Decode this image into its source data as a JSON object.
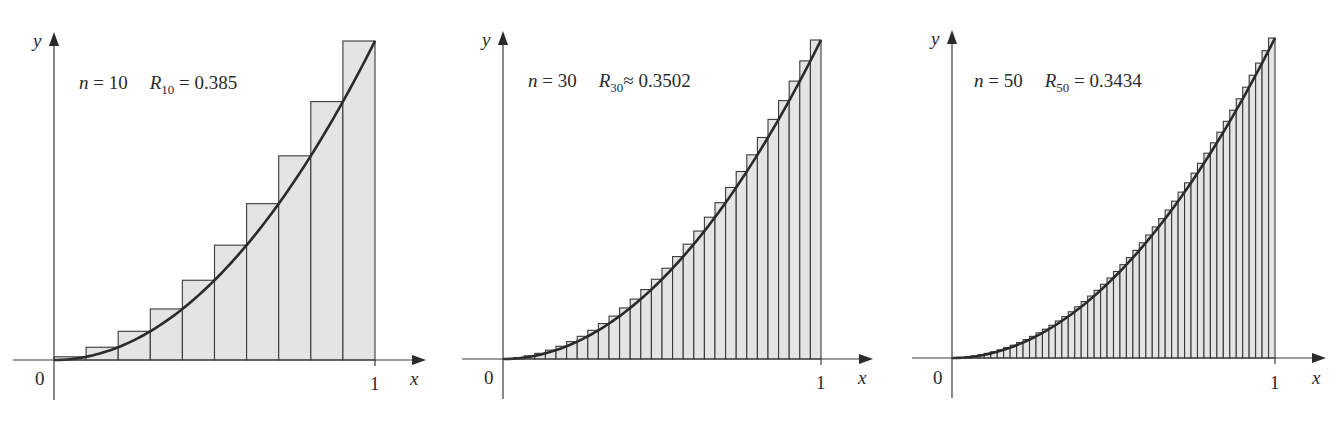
{
  "chart_data": [
    {
      "type": "bar",
      "title": "n = 10   R10 = 0.385",
      "function": "y = x^2",
      "method": "right endpoint Riemann sum",
      "n": 10,
      "annotation": {
        "n_label": "n",
        "n_value": "10",
        "R_label": "R",
        "R_sub": "10",
        "relation": "=",
        "R_value": "0.385"
      },
      "xlabel": "x",
      "ylabel": "y",
      "x_ticks": [
        "0",
        "1"
      ],
      "xlim": [
        0,
        1
      ],
      "ylim": [
        0,
        1
      ],
      "grid": false,
      "categories": [
        "0.1",
        "0.2",
        "0.3",
        "0.4",
        "0.5",
        "0.6",
        "0.7",
        "0.8",
        "0.9",
        "1.0"
      ],
      "values": [
        0.01,
        0.04,
        0.09,
        0.16,
        0.25,
        0.36,
        0.49,
        0.64,
        0.81,
        1.0
      ]
    },
    {
      "type": "bar",
      "title": "n = 30   R30 ≈ 0.3502",
      "function": "y = x^2",
      "method": "right endpoint Riemann sum",
      "n": 30,
      "annotation": {
        "n_label": "n",
        "n_value": "30",
        "R_label": "R",
        "R_sub": "30",
        "relation": "≈",
        "R_value": "0.3502"
      },
      "xlabel": "x",
      "ylabel": "y",
      "x_ticks": [
        "0",
        "1"
      ],
      "xlim": [
        0,
        1
      ],
      "ylim": [
        0,
        1
      ],
      "grid": false
    },
    {
      "type": "bar",
      "title": "n = 50   R50 = 0.3434",
      "function": "y = x^2",
      "method": "right endpoint Riemann sum",
      "n": 50,
      "annotation": {
        "n_label": "n",
        "n_value": "50",
        "R_label": "R",
        "R_sub": "50",
        "relation": "=",
        "R_value": "0.3434"
      },
      "xlabel": "x",
      "ylabel": "y",
      "x_ticks": [
        "0",
        "1"
      ],
      "xlim": [
        0,
        1
      ],
      "ylim": [
        0,
        1
      ],
      "grid": false
    }
  ],
  "panels": [
    {
      "origin_label": "0",
      "one_label": "1",
      "x_label": "x",
      "y_label": "y",
      "n_label": "n",
      "n_eq": " = 10",
      "R_label": "R",
      "R_sub": "10",
      "R_eq": " = 0.385"
    },
    {
      "origin_label": "0",
      "one_label": "1",
      "x_label": "x",
      "y_label": "y",
      "n_label": "n",
      "n_eq": " = 30",
      "R_label": "R",
      "R_sub": "30",
      "R_eq": "≈ 0.3502"
    },
    {
      "origin_label": "0",
      "one_label": "1",
      "x_label": "x",
      "y_label": "y",
      "n_label": "n",
      "n_eq": " = 50",
      "R_label": "R",
      "R_sub": "50",
      "R_eq": " = 0.3434"
    }
  ],
  "colors": {
    "rect_fill": "#e4e4e4",
    "rect_stroke": "#3a3a3a",
    "curve": "#2a2a2a",
    "axis": "#3a3a3a"
  }
}
